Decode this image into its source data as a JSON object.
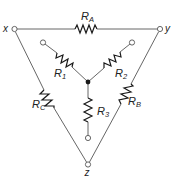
{
  "diagram": {
    "terminals": {
      "x": {
        "label": "x"
      },
      "y": {
        "label": "y"
      },
      "z": {
        "label": "z"
      }
    },
    "delta_resistors": [
      {
        "id": "RA",
        "symbol": "R",
        "subscript": "A",
        "between": [
          "x",
          "y"
        ]
      },
      {
        "id": "RB",
        "symbol": "R",
        "subscript": "B",
        "between": [
          "y",
          "z"
        ]
      },
      {
        "id": "RC",
        "symbol": "R",
        "subscript": "C",
        "between": [
          "x",
          "z"
        ]
      }
    ],
    "wye_resistors": [
      {
        "id": "R1",
        "symbol": "R",
        "subscript": "1",
        "to_terminal": "inner-x"
      },
      {
        "id": "R2",
        "symbol": "R",
        "subscript": "2",
        "to_terminal": "inner-y"
      },
      {
        "id": "R3",
        "symbol": "R",
        "subscript": "3",
        "to_terminal": "inner-z"
      }
    ],
    "colors": {
      "line": "#555555",
      "resistor": "#1a1a1a",
      "background": "#ffffff"
    }
  }
}
